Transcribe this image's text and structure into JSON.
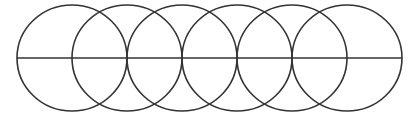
{
  "diagram": {
    "type": "overlapping-circles-with-horizontal-diameter",
    "background": "#ffffff",
    "stroke_color": "#333333",
    "stroke_width": 1.6,
    "circle_count": 6,
    "center_y": 58,
    "radius_x": 55,
    "radius_y": 53,
    "circle_centers_x": [
      72,
      127,
      182,
      237,
      292,
      347
    ],
    "line": {
      "x1": 17,
      "x2": 402,
      "y": 58
    }
  }
}
